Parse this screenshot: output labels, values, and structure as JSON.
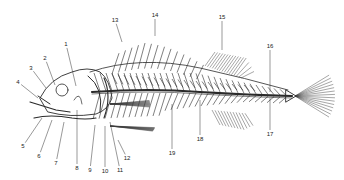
{
  "diagram": {
    "ink_color": "#2a2a2a",
    "background": "#ffffff",
    "labels": [
      {
        "id": "1",
        "text": "1",
        "x": 66,
        "y": 44,
        "tx": 76,
        "ty": 86
      },
      {
        "id": "2",
        "text": "2",
        "x": 45,
        "y": 58,
        "tx": 55,
        "ty": 85
      },
      {
        "id": "3",
        "text": "3",
        "x": 31,
        "y": 68,
        "tx": 46,
        "ty": 88
      },
      {
        "id": "4",
        "text": "4",
        "x": 18,
        "y": 82,
        "tx": 38,
        "ty": 98
      },
      {
        "id": "5",
        "text": "5",
        "x": 23,
        "y": 146,
        "tx": 42,
        "ty": 118
      },
      {
        "id": "6",
        "text": "6",
        "x": 39,
        "y": 156,
        "tx": 52,
        "ty": 120
      },
      {
        "id": "7",
        "text": "7",
        "x": 56,
        "y": 163,
        "tx": 64,
        "ty": 122
      },
      {
        "id": "8",
        "text": "8",
        "x": 77,
        "y": 168,
        "tx": 77,
        "ty": 110
      },
      {
        "id": "9",
        "text": "9",
        "x": 90,
        "y": 170,
        "tx": 95,
        "ty": 125
      },
      {
        "id": "10",
        "text": "10",
        "x": 105,
        "y": 171,
        "tx": 105,
        "ty": 126
      },
      {
        "id": "11",
        "text": "11",
        "x": 120,
        "y": 170,
        "tx": 110,
        "ty": 122
      },
      {
        "id": "12",
        "text": "12",
        "x": 127,
        "y": 158,
        "tx": 118,
        "ty": 140
      },
      {
        "id": "13",
        "text": "13",
        "x": 115,
        "y": 20,
        "tx": 122,
        "ty": 42
      },
      {
        "id": "14",
        "text": "14",
        "x": 155,
        "y": 15,
        "tx": 155,
        "ty": 36
      },
      {
        "id": "15",
        "text": "15",
        "x": 222,
        "y": 17,
        "tx": 222,
        "ty": 50
      },
      {
        "id": "16",
        "text": "16",
        "x": 270,
        "y": 46,
        "tx": 270,
        "ty": 92
      },
      {
        "id": "17",
        "text": "17",
        "x": 270,
        "y": 134,
        "tx": 270,
        "ty": 98
      },
      {
        "id": "18",
        "text": "18",
        "x": 200,
        "y": 139,
        "tx": 200,
        "ty": 100
      },
      {
        "id": "19",
        "text": "19",
        "x": 172,
        "y": 153,
        "tx": 172,
        "ty": 104
      }
    ]
  }
}
